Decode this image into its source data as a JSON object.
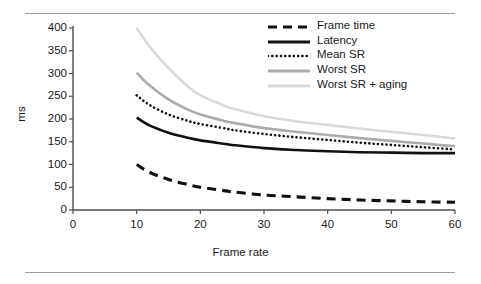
{
  "chart_data": {
    "type": "line",
    "title": "",
    "xlabel": "Frame rate",
    "ylabel": "ms",
    "xlim": [
      0,
      60
    ],
    "ylim": [
      0,
      400
    ],
    "xticks": [
      0,
      10,
      20,
      30,
      40,
      50,
      60
    ],
    "yticks": [
      0,
      50,
      100,
      150,
      200,
      250,
      300,
      350,
      400
    ],
    "grid": false,
    "legend_position": "top-right",
    "x": [
      10,
      12,
      15,
      18,
      20,
      24,
      25,
      30,
      35,
      40,
      45,
      50,
      55,
      60
    ],
    "series": [
      {
        "name": "Frame time",
        "style": "dashed",
        "color": "#111111",
        "values": [
          100,
          83,
          67,
          56,
          50,
          42,
          40,
          33,
          29,
          25,
          22,
          20,
          18,
          17
        ]
      },
      {
        "name": "Latency",
        "style": "solid",
        "color": "#111111",
        "values": [
          203,
          186,
          170,
          159,
          153,
          145,
          143,
          136,
          132,
          129,
          127,
          126,
          125,
          125
        ]
      },
      {
        "name": "Mean SR",
        "style": "dotted",
        "color": "#111111",
        "values": [
          252,
          231,
          210,
          196,
          189,
          179,
          176,
          167,
          160,
          154,
          148,
          143,
          138,
          133
        ]
      },
      {
        "name": "Worst SR",
        "style": "solid",
        "color": "#ababab",
        "values": [
          302,
          274,
          243,
          221,
          210,
          195,
          192,
          180,
          172,
          165,
          158,
          152,
          146,
          140
        ]
      },
      {
        "name": "Worst SR + aging",
        "style": "solid",
        "color": "#d9d9d9",
        "values": [
          400,
          360,
          312,
          272,
          252,
          228,
          223,
          206,
          195,
          187,
          179,
          172,
          165,
          157
        ]
      }
    ]
  },
  "axes": {
    "y_tick_labels": [
      "400",
      "350",
      "300",
      "250",
      "200",
      "150",
      "100",
      "50",
      "0"
    ],
    "x_tick_labels": [
      "0",
      "10",
      "20",
      "30",
      "40",
      "50",
      "60"
    ],
    "y_axis_title": "ms",
    "x_axis_title": "Frame rate"
  },
  "legend": {
    "items": [
      {
        "label": "Frame time"
      },
      {
        "label": "Latency"
      },
      {
        "label": "Mean SR"
      },
      {
        "label": "Worst SR"
      },
      {
        "label": "Worst SR + aging"
      }
    ]
  },
  "colors": {
    "axis": "#4d4d4d",
    "rule": "#9a9a9a",
    "text": "#1a1a1a",
    "series_dark": "#111111",
    "series_mid_gray": "#ababab",
    "series_light_gray": "#d9d9d9",
    "background": "#ffffff"
  }
}
